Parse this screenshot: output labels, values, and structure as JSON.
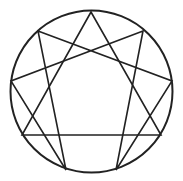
{
  "diagram": {
    "type": "enneagram",
    "stroke_color": "#222222",
    "background": "#ffffff",
    "circle": {
      "cx": 91.5,
      "cy": 91.5,
      "r": 81
    },
    "points": {
      "9": [
        91,
        12
      ],
      "1": [
        143,
        31
      ],
      "2": [
        172,
        81
      ],
      "3": [
        161,
        135
      ],
      "4": [
        116,
        170
      ],
      "5": [
        66,
        170
      ],
      "6": [
        22,
        135
      ],
      "7": [
        11,
        81
      ],
      "8": [
        38,
        31
      ]
    },
    "triangle": [
      "9",
      "3",
      "6"
    ],
    "hexad": [
      "1",
      "4",
      "2",
      "8",
      "5",
      "7"
    ]
  }
}
